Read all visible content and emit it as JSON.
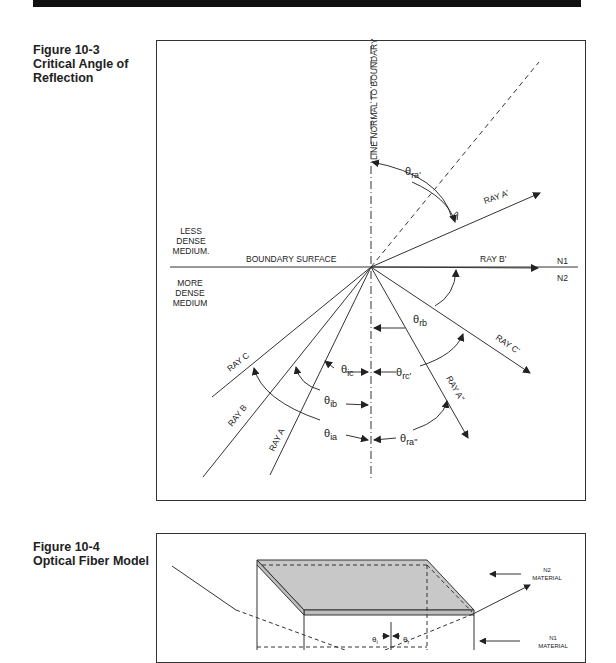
{
  "figure_10_3": {
    "number": "Figure 10-3",
    "title_line1": "Critical Angle of",
    "title_line2": "Reflection",
    "labels": {
      "normal_line": "LINE NORMAL TO BOUNDARY",
      "boundary": "BOUNDARY SURFACE",
      "less_dense_1": "LESS",
      "less_dense_2": "DENSE",
      "less_dense_3": "MEDIUM.",
      "more_dense_1": "MORE",
      "more_dense_2": "DENSE",
      "more_dense_3": "MEDIUM",
      "n1": "N1",
      "n2": "N2",
      "ray_a": "RAY A",
      "ray_b": "RAY B",
      "ray_c": "RAY C",
      "ray_a_prime": "RAY A'",
      "ray_b_prime": "RAY B'",
      "ray_c_prime": "RAY C'",
      "ray_a_dprime": "RAY A\"",
      "theta": "θ",
      "sub_ra_prime": "ra'",
      "sub_rb": "rb",
      "sub_rc_prime": "rc'",
      "sub_ra_dprime": "ra\"",
      "sub_ic": "ic",
      "sub_ib": "ib",
      "sub_ia": "ia"
    }
  },
  "figure_10_4": {
    "number": "Figure 10-4",
    "title": "Optical Fiber Model",
    "labels": {
      "n2_1": "N2",
      "n2_2": "MATERIAL",
      "n1_1": "N1",
      "n1_2": "MATERIAL",
      "theta": "θ",
      "sub_i": "i",
      "sub_r": "r"
    }
  },
  "colors": {
    "ink": "#222222",
    "top_bar": "#111111",
    "cladding_fill": "#c8c8c8"
  }
}
